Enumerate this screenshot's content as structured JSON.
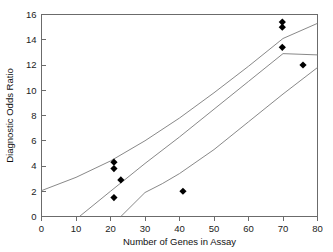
{
  "chart_data": {
    "type": "scatter",
    "title": "",
    "xlabel": "Number of Genes in Assay",
    "ylabel": "Diagnostic Odds Ratio",
    "xlim": [
      0,
      80
    ],
    "ylim": [
      0,
      16
    ],
    "xticks": [
      0,
      10,
      20,
      30,
      40,
      50,
      60,
      70,
      80
    ],
    "yticks": [
      0,
      2,
      4,
      6,
      8,
      10,
      12,
      14,
      16
    ],
    "xtick_labels": [
      "0",
      "10",
      "20",
      "30",
      "40",
      "50",
      "60",
      "70",
      "80"
    ],
    "ytick_labels": [
      "0",
      "2",
      "4",
      "6",
      "8",
      "10",
      "12",
      "14",
      "16"
    ],
    "grid": false,
    "legend": false,
    "marker": "diamond",
    "marker_color": "#000000",
    "line_color": "#7a7a7a",
    "points": [
      {
        "x": 21.0,
        "y": 4.3
      },
      {
        "x": 21.0,
        "y": 3.8
      },
      {
        "x": 23.0,
        "y": 2.9
      },
      {
        "x": 21.0,
        "y": 1.5
      },
      {
        "x": 41.0,
        "y": 2.0
      },
      {
        "x": 69.8,
        "y": 15.4
      },
      {
        "x": 69.8,
        "y": 15.0
      },
      {
        "x": 69.8,
        "y": 13.4
      },
      {
        "x": 75.8,
        "y": 12.0
      }
    ],
    "series": [
      {
        "name": "Regression fit",
        "kind": "line",
        "points": [
          {
            "x": 11.0,
            "y": 0.0
          },
          {
            "x": 20.0,
            "y": 2.0
          },
          {
            "x": 30.0,
            "y": 4.2
          },
          {
            "x": 40.0,
            "y": 6.3
          },
          {
            "x": 50.0,
            "y": 8.5
          },
          {
            "x": 60.0,
            "y": 10.7
          },
          {
            "x": 70.0,
            "y": 12.9
          },
          {
            "x": 80.0,
            "y": 12.8
          }
        ]
      },
      {
        "name": "Upper confidence band",
        "kind": "line",
        "points": [
          {
            "x": 0.0,
            "y": 2.05
          },
          {
            "x": 10.0,
            "y": 3.1
          },
          {
            "x": 20.0,
            "y": 4.4
          },
          {
            "x": 30.0,
            "y": 6.0
          },
          {
            "x": 40.0,
            "y": 7.8
          },
          {
            "x": 50.0,
            "y": 9.8
          },
          {
            "x": 60.0,
            "y": 11.9
          },
          {
            "x": 70.0,
            "y": 14.1
          },
          {
            "x": 80.0,
            "y": 15.3
          }
        ]
      },
      {
        "name": "Lower confidence band",
        "kind": "line",
        "points": [
          {
            "x": 23.0,
            "y": 0.0
          },
          {
            "x": 30.0,
            "y": 1.9
          },
          {
            "x": 35.0,
            "y": 2.6
          },
          {
            "x": 40.0,
            "y": 3.4
          },
          {
            "x": 50.0,
            "y": 5.3
          },
          {
            "x": 60.0,
            "y": 7.5
          },
          {
            "x": 70.0,
            "y": 9.7
          },
          {
            "x": 80.0,
            "y": 11.8
          }
        ]
      }
    ]
  },
  "axes": {
    "x_title": "Number of Genes in Assay",
    "y_title": "Diagnostic Odds Ratio"
  }
}
